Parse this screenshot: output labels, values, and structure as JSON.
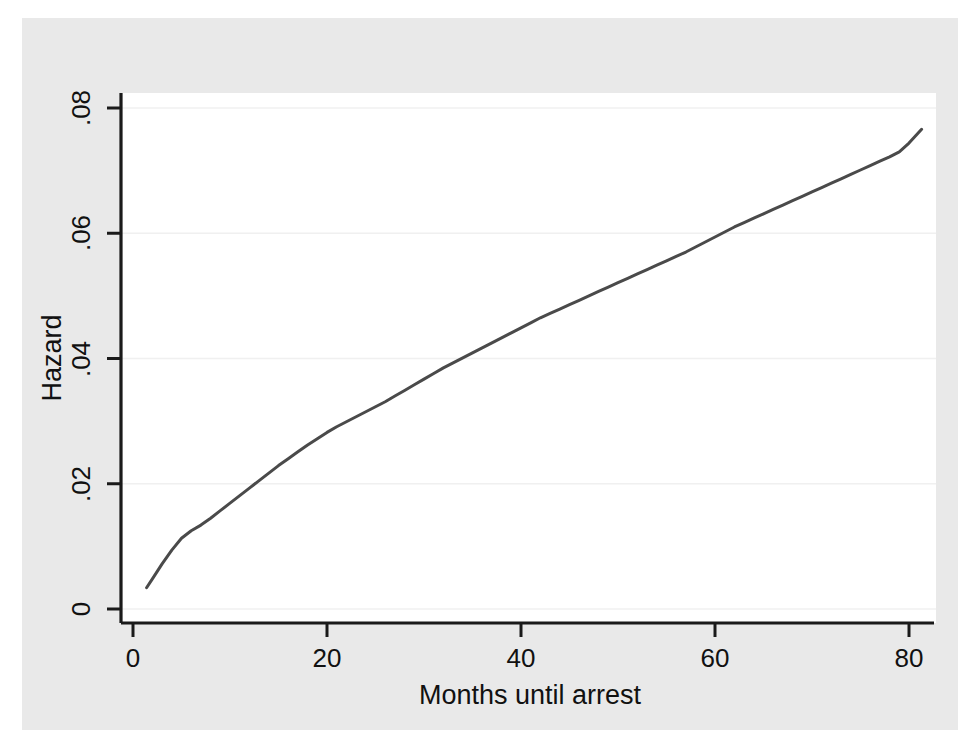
{
  "figure": {
    "background_color": "#ffffff",
    "canvas_color": "#e9e9e9",
    "plot_color": "#ffffff",
    "line_color": "#4a4a4a",
    "grid_color": "#f0f0f0",
    "axis_color": "#1a1a1a"
  },
  "chart_data": {
    "type": "line",
    "title": "",
    "subtitle": "",
    "xlabel": "Months until arrest",
    "ylabel": "Hazard",
    "xlim": [
      0,
      82
    ],
    "ylim": [
      0,
      0.08
    ],
    "xticks": [
      0,
      20,
      40,
      60,
      80
    ],
    "xticklabels": [
      "0",
      "20",
      "40",
      "60",
      "80"
    ],
    "yticks": [
      0,
      0.02,
      0.04,
      0.06,
      0.08
    ],
    "yticklabels": [
      "0",
      ".02",
      ".04",
      ".06",
      ".08"
    ],
    "grid": true,
    "grid_axis": "y",
    "legend": null,
    "legend_position": "none",
    "annotations": [],
    "series": [
      {
        "name": "Smoothed hazard estimate",
        "x": [
          1.4,
          2,
          3,
          4,
          5,
          6,
          7,
          8,
          9,
          10,
          11,
          12,
          13,
          14,
          15,
          16,
          17,
          18,
          19,
          20,
          21,
          22,
          23,
          24,
          25,
          26,
          27,
          28,
          29,
          30,
          31,
          32,
          33,
          34,
          35,
          36,
          37,
          38,
          39,
          40,
          41,
          42,
          43,
          44,
          45,
          46,
          47,
          48,
          49,
          50,
          51,
          52,
          53,
          54,
          55,
          56,
          57,
          58,
          59,
          60,
          61,
          62,
          63,
          64,
          65,
          66,
          67,
          68,
          69,
          70,
          71,
          72,
          73,
          74,
          75,
          76,
          77,
          78,
          79,
          80,
          81.3
        ],
        "y": [
          0.0034,
          0.0048,
          0.0072,
          0.0094,
          0.0113,
          0.0125,
          0.0134,
          0.0145,
          0.0157,
          0.0169,
          0.0181,
          0.0193,
          0.0205,
          0.0217,
          0.0229,
          0.024,
          0.0251,
          0.0262,
          0.0272,
          0.0282,
          0.0291,
          0.0299,
          0.0307,
          0.0315,
          0.0323,
          0.0331,
          0.034,
          0.0349,
          0.0358,
          0.0367,
          0.0376,
          0.0385,
          0.0393,
          0.0401,
          0.0409,
          0.0417,
          0.0425,
          0.0433,
          0.0441,
          0.0449,
          0.0457,
          0.0465,
          0.0472,
          0.0479,
          0.0486,
          0.0493,
          0.05,
          0.0507,
          0.0514,
          0.0521,
          0.0528,
          0.0535,
          0.0542,
          0.0549,
          0.0556,
          0.0563,
          0.057,
          0.0578,
          0.0586,
          0.0594,
          0.0602,
          0.061,
          0.0617,
          0.0624,
          0.0631,
          0.0638,
          0.0645,
          0.0652,
          0.0659,
          0.0666,
          0.0673,
          0.068,
          0.0687,
          0.0694,
          0.0701,
          0.0708,
          0.0715,
          0.0722,
          0.073,
          0.0744,
          0.0766
        ]
      }
    ]
  }
}
